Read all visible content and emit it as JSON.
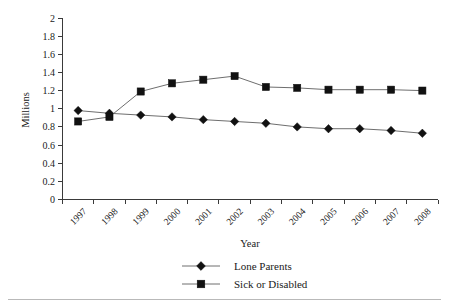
{
  "chart_data": {
    "type": "line",
    "title": "",
    "xlabel": "Year",
    "ylabel": "Millions",
    "categories": [
      "1997",
      "1998",
      "1999",
      "2000",
      "2001",
      "2002",
      "2003",
      "2004",
      "2005",
      "2006",
      "2007",
      "2008"
    ],
    "ylim": [
      0,
      2
    ],
    "ytick_labels": [
      "0",
      "0.2",
      "0.4",
      "0.6",
      "0.8",
      "1",
      "1.2",
      "1.4",
      "1.6",
      "1.8",
      "2"
    ],
    "ytick_values": [
      0,
      0.2,
      0.4,
      0.6,
      0.8,
      1,
      1.2,
      1.4,
      1.6,
      1.8,
      2
    ],
    "grid": false,
    "legend_position": "bottom",
    "series": [
      {
        "name": "Lone Parents",
        "marker": "diamond",
        "color": "#111111",
        "values": [
          0.98,
          0.95,
          0.93,
          0.91,
          0.88,
          0.86,
          0.84,
          0.8,
          0.78,
          0.78,
          0.76,
          0.73
        ]
      },
      {
        "name": "Sick or Disabled",
        "marker": "square",
        "color": "#111111",
        "values": [
          0.86,
          0.91,
          1.19,
          1.28,
          1.32,
          1.36,
          1.24,
          1.23,
          1.21,
          1.21,
          1.21,
          1.2
        ]
      }
    ]
  },
  "axis": {
    "x_title": "Year",
    "y_title": "Millions"
  },
  "legend": {
    "items": [
      {
        "label": "Lone Parents",
        "marker": "diamond"
      },
      {
        "label": "Sick or Disabled",
        "marker": "square"
      }
    ]
  },
  "colors": {
    "axis": "#3a3a3a",
    "line": "#6e6e6e",
    "marker": "#111111",
    "text": "#1a1a1a",
    "rule": "#b9b9b9",
    "background": "#ffffff"
  }
}
